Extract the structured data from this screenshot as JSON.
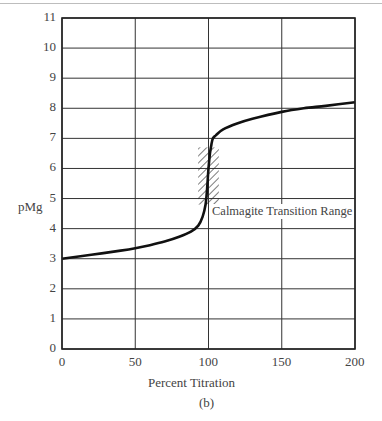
{
  "chart_data": {
    "type": "line",
    "title": "",
    "caption": "(b)",
    "xlabel": "Percent Titration",
    "ylabel": "pMg",
    "xlim": [
      0,
      200
    ],
    "ylim": [
      0,
      11
    ],
    "x_ticks": [
      "0",
      "50",
      "100",
      "150",
      "200"
    ],
    "y_ticks": [
      "0",
      "1",
      "2",
      "3",
      "4",
      "5",
      "6",
      "7",
      "8",
      "9",
      "10",
      "11"
    ],
    "grid": true,
    "legend": null,
    "series": [
      {
        "name": "Titration curve",
        "x": [
          0,
          20,
          40,
          50,
          60,
          70,
          80,
          88,
          93,
          96,
          98,
          99,
          100,
          101,
          102,
          103,
          105,
          110,
          120,
          130,
          150,
          165,
          180,
          200
        ],
        "y": [
          3.0,
          3.13,
          3.27,
          3.35,
          3.45,
          3.57,
          3.73,
          3.9,
          4.1,
          4.4,
          4.8,
          5.3,
          6.0,
          6.5,
          6.8,
          7.0,
          7.1,
          7.3,
          7.5,
          7.65,
          7.88,
          8.0,
          8.08,
          8.2
        ]
      }
    ],
    "annotations": [
      {
        "text": "Calmagite Transition Range",
        "type": "hatched-region",
        "x_range": [
          95,
          105
        ],
        "y_range": [
          4.8,
          6.7
        ]
      }
    ]
  }
}
